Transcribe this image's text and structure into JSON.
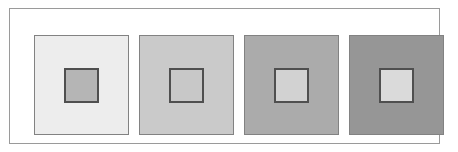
{
  "figure": {
    "kind": "simultaneous-contrast-plate",
    "background_color": "#ffffff",
    "frame": {
      "border_color": "#9a9a9a",
      "border_width_px": 1,
      "fill_color": "#ffffff"
    },
    "layout": {
      "panel_count": 4,
      "panel_width_px": 95,
      "panel_height_px": 100,
      "panel_gap_px": 10,
      "inner_square_size_px": 35,
      "panel_outline_color": "#828282",
      "inner_square_outline_color": "#4f4f4f",
      "inner_square_outline_width_px": 2
    },
    "panels": [
      {
        "index": 1,
        "name": "panel-1",
        "surround_label": "lightest surround",
        "surround_color": "#ededed",
        "inner_label": "darkest inner patch",
        "inner_color": "#b5b5b5",
        "surround_gray_level": 237,
        "inner_gray_level": 181
      },
      {
        "index": 2,
        "name": "panel-2",
        "surround_label": "light surround",
        "surround_color": "#cacaca",
        "inner_label": "inner patch matching surround",
        "inner_color": "#c8c8c8",
        "surround_gray_level": 202,
        "inner_gray_level": 200
      },
      {
        "index": 3,
        "name": "panel-3",
        "surround_label": "medium-dark surround",
        "surround_color": "#ababab",
        "inner_label": "light inner patch",
        "inner_color": "#d2d2d2",
        "surround_gray_level": 171,
        "inner_gray_level": 210
      },
      {
        "index": 4,
        "name": "panel-4",
        "surround_label": "darkest surround",
        "surround_color": "#969696",
        "inner_label": "lightest inner patch",
        "inner_color": "#dadada",
        "surround_gray_level": 150,
        "inner_gray_level": 218
      }
    ]
  }
}
